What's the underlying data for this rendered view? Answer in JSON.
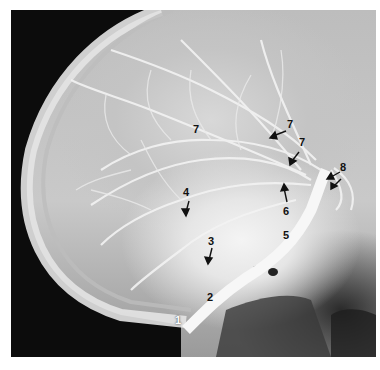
{
  "image": {
    "description": "Lateral cerebral angiogram (carotid injection) with numbered anatomical labels",
    "colors": {
      "background": "#ffffff",
      "dark_field": "#0c0c0c",
      "bone": "#e8e8e8",
      "label": "#111111"
    }
  },
  "labels": [
    {
      "id": "1",
      "x": 178,
      "y": 321,
      "arrow": false,
      "light": true
    },
    {
      "id": "2",
      "x": 210,
      "y": 298,
      "arrow": false,
      "light": false
    },
    {
      "id": "3",
      "x": 211,
      "y": 241,
      "arrow": true,
      "light": false
    },
    {
      "id": "4",
      "x": 186,
      "y": 191,
      "arrow": true,
      "light": false
    },
    {
      "id": "5",
      "x": 286,
      "y": 235,
      "arrow": false,
      "light": false
    },
    {
      "id": "6",
      "x": 286,
      "y": 210,
      "arrow": true,
      "light": false
    },
    {
      "id": "7",
      "x": 196,
      "y": 128,
      "arrow": false,
      "light": false
    },
    {
      "id": "7",
      "x": 288,
      "y": 122,
      "arrow": true,
      "light": false
    },
    {
      "id": "7",
      "x": 300,
      "y": 141,
      "arrow": true,
      "light": false
    },
    {
      "id": "8",
      "x": 341,
      "y": 165,
      "arrow": true,
      "light": false
    }
  ]
}
